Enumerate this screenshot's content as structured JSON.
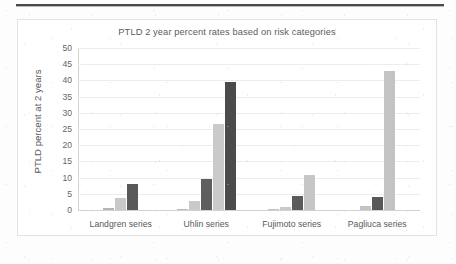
{
  "chart_data": {
    "type": "bar",
    "title": "PTLD 2 year percent rates based on risk categories",
    "xlabel": "",
    "ylabel": "PTLD percent at 2 years",
    "ylim": [
      0,
      50
    ],
    "yticks": [
      50,
      45,
      40,
      35,
      30,
      25,
      20,
      15,
      10,
      5,
      0
    ],
    "grid": true,
    "legend": "none",
    "categories": [
      "Landgren series",
      "Uhlin series",
      "Fujimoto series",
      "Pagliuca series"
    ],
    "groups": [
      {
        "category": "Landgren series",
        "bars": [
          {
            "value": 0.7,
            "color": "#b6b6b6"
          },
          {
            "value": 3.6,
            "color": "#c9c9c9"
          },
          {
            "value": 8.0,
            "color": "#595959"
          }
        ]
      },
      {
        "category": "Uhlin series",
        "bars": [
          {
            "value": 0.3,
            "color": "#bdbdbd"
          },
          {
            "value": 2.7,
            "color": "#c9c9c9"
          },
          {
            "value": 9.7,
            "color": "#5e5e5e"
          },
          {
            "value": 26.5,
            "color": "#cacaca"
          },
          {
            "value": 39.5,
            "color": "#4b4b4b"
          }
        ]
      },
      {
        "category": "Fujimoto series",
        "bars": [
          {
            "value": 0.2,
            "color": "#c2c2c2"
          },
          {
            "value": 1.0,
            "color": "#c9c9c9"
          },
          {
            "value": 4.2,
            "color": "#5b5b5b"
          },
          {
            "value": 10.8,
            "color": "#c6c6c6"
          }
        ]
      },
      {
        "category": "Pagliuca series",
        "bars": [
          {
            "value": 1.2,
            "color": "#c4c4c4"
          },
          {
            "value": 4.0,
            "color": "#585858"
          },
          {
            "value": 43.0,
            "color": "#c3c3c3"
          }
        ]
      }
    ],
    "colors": {
      "light_gray": "#c9c9c9",
      "dark_gray": "#545454",
      "gridline": "#ededed",
      "axis": "#d2d2d2",
      "text": "#5a5a5a"
    }
  }
}
